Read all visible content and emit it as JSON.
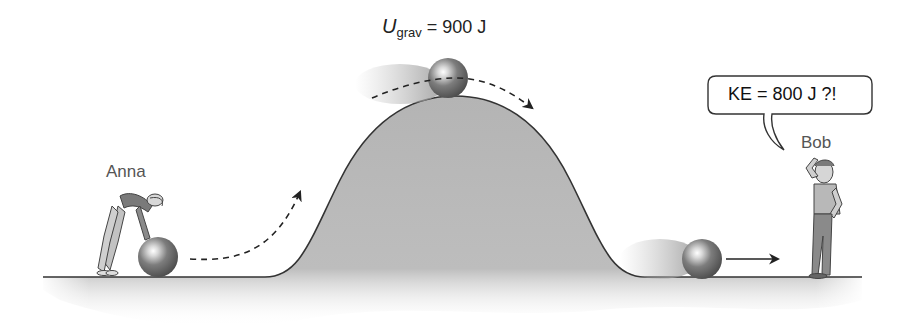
{
  "figure": {
    "labels": {
      "energy_symbol": "U",
      "energy_subscript": "grav",
      "energy_value": " = 900 J",
      "speech_bubble": "KE = 800 J ?!",
      "person_left": "Anna",
      "person_right": "Bob"
    },
    "colors": {
      "ground_fill": "#b4b4b4",
      "ground_edge": "#333333",
      "ball_dark": "#555555",
      "ball_mid": "#8a8a8a",
      "ball_highlight": "#ffffff",
      "arrow": "#222222",
      "background": "#ffffff"
    },
    "icons": {
      "ball": "sphere",
      "trajectory": "dashed-arrow",
      "motion": "solid-arrow"
    }
  }
}
